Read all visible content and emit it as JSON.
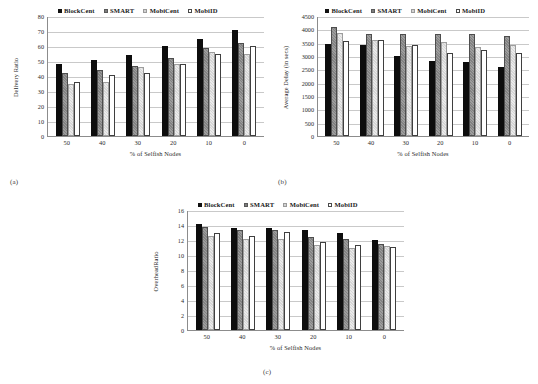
{
  "figure": {
    "captions": {
      "a": "(a)",
      "b": "(b)",
      "c": "(c)"
    },
    "xlabel": "% of Selfish Nodes",
    "legend": [
      {
        "label": "BlockCent",
        "color": "#0d0d0d"
      },
      {
        "label": "SMART",
        "color": "#828282"
      },
      {
        "label": "MobiCent",
        "color": "#d6d6d6"
      },
      {
        "label": "MobiID",
        "color": "#ffffff"
      }
    ]
  },
  "chart_data": [
    {
      "id": "a",
      "type": "bar",
      "title": "",
      "xlabel": "% of Selfish Nodes",
      "ylabel": "Delivery Ratio",
      "ylim": [
        0,
        80
      ],
      "yticks": [
        0,
        10,
        20,
        30,
        40,
        50,
        60,
        70,
        80
      ],
      "grid": true,
      "legend_position": "top-center",
      "categories": [
        "50",
        "40",
        "30",
        "20",
        "10",
        "0"
      ],
      "series": [
        {
          "name": "BlockCent",
          "values": [
            48,
            51,
            54,
            60,
            65,
            71
          ]
        },
        {
          "name": "SMART",
          "values": [
            42,
            44,
            47,
            52,
            59,
            62
          ]
        },
        {
          "name": "MobiCent",
          "values": [
            35,
            36,
            46,
            48,
            56,
            55
          ]
        },
        {
          "name": "MobiID",
          "values": [
            36,
            41,
            42,
            48,
            55,
            60
          ]
        }
      ]
    },
    {
      "id": "b",
      "type": "bar",
      "title": "",
      "xlabel": "% of Selfish Nodes",
      "ylabel": "Average Delay (in secs)",
      "ylim": [
        0,
        4500
      ],
      "yticks": [
        0,
        500,
        1000,
        1500,
        2000,
        2500,
        3000,
        3500,
        4000,
        4500
      ],
      "grid": true,
      "legend_position": "top-center",
      "categories": [
        "50",
        "40",
        "30",
        "20",
        "10",
        "0"
      ],
      "series": [
        {
          "name": "BlockCent",
          "values": [
            3450,
            3400,
            3010,
            2800,
            2760,
            2580
          ]
        },
        {
          "name": "SMART",
          "values": [
            4080,
            3810,
            3820,
            3840,
            3820,
            3750
          ]
        },
        {
          "name": "MobiCent",
          "values": [
            3880,
            3610,
            3380,
            3520,
            3330,
            3430
          ]
        },
        {
          "name": "MobiID",
          "values": [
            3580,
            3610,
            3430,
            3110,
            3220,
            3110
          ]
        }
      ]
    },
    {
      "id": "c",
      "type": "bar",
      "title": "",
      "xlabel": "% of Selfish Nodes",
      "ylabel": "OverheadRatio",
      "ylim": [
        0,
        16
      ],
      "yticks": [
        0,
        2,
        4,
        6,
        8,
        10,
        12,
        14,
        16
      ],
      "grid": true,
      "legend_position": "top-center",
      "categories": [
        "50",
        "40",
        "30",
        "20",
        "10",
        "0"
      ],
      "series": [
        {
          "name": "BlockCent",
          "values": [
            14.1,
            13.6,
            13.6,
            13.4,
            13.0,
            12.0
          ]
        },
        {
          "name": "SMART",
          "values": [
            13.7,
            13.3,
            13.4,
            12.4,
            12.1,
            11.5
          ]
        },
        {
          "name": "MobiCent",
          "values": [
            12.5,
            12.1,
            12.2,
            11.4,
            10.9,
            11.2
          ]
        },
        {
          "name": "MobiID",
          "values": [
            13.0,
            12.6,
            13.1,
            11.7,
            11.4,
            11.1
          ]
        }
      ]
    }
  ]
}
